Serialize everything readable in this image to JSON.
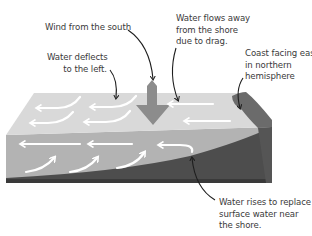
{
  "diagram": {
    "colors": {
      "background": "#ffffff",
      "water_surface": "#d9d9d9",
      "water_front": "#b3b3b3",
      "coast_top": "#6b6b6b",
      "land_side": "#555555",
      "land_front": "#4a4a4a",
      "seabed_strip": "#3c3c3c",
      "wind_arrow": "#8c8c8c",
      "current_arrows": "#ffffff",
      "leader_lines": "#1e1e1e",
      "text": "#3a3a3a"
    },
    "labels": {
      "wind": [
        "Wind from the south"
      ],
      "deflect": [
        "Water deflects",
        "to the left."
      ],
      "flows_away": [
        "Water flows away",
        "from the shore",
        "due to drag."
      ],
      "coast": [
        "Coast facing east",
        "in northern",
        "hemisphere"
      ],
      "rises": [
        "Water rises to replace",
        "surface water near",
        "the shore."
      ]
    },
    "icons": {
      "wind_arrow": "down-arrow-icon",
      "surface_currents": "left-arrow-icon",
      "upwelling_currents": "curved-up-arrow-icon"
    }
  }
}
